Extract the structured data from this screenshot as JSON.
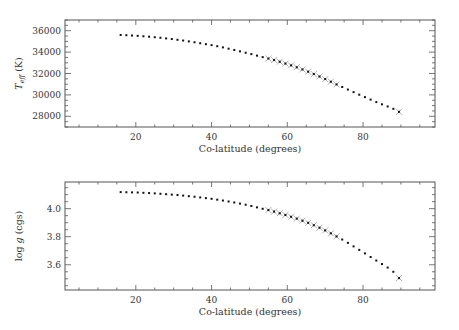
{
  "chart_data": [
    {
      "type": "scatter",
      "title": "",
      "xlabel": "Co-latitude (degrees)",
      "ylabel": "T_eff (K)",
      "ylabel_main": "T",
      "ylabel_sub": "eff",
      "ylabel_unit": " (K)",
      "xlim": [
        1.3,
        99
      ],
      "ylim": [
        27000,
        37000
      ],
      "xticks": [
        20,
        40,
        60,
        80
      ],
      "yticks": [
        28000,
        30000,
        32000,
        34000,
        36000
      ],
      "grid": false,
      "marker": "dot",
      "highlight_marker": "x",
      "highlight_range": [
        55,
        73
      ],
      "x": [
        16,
        17.5,
        19,
        20.5,
        22,
        23.5,
        25,
        26.5,
        28,
        29.5,
        31,
        32.5,
        34,
        35.5,
        37,
        38.5,
        40,
        41.5,
        43,
        44.5,
        46,
        47.5,
        49,
        50.5,
        52,
        53.5,
        55,
        56.5,
        58,
        59.5,
        61,
        62.5,
        64,
        65.5,
        67,
        68.5,
        70,
        71.5,
        73,
        74.5,
        76,
        77.5,
        79,
        80.5,
        82,
        83.5,
        85,
        86.5,
        88,
        89.5
      ],
      "values": [
        35600,
        35580,
        35550,
        35520,
        35480,
        35440,
        35390,
        35340,
        35280,
        35220,
        35150,
        35080,
        35000,
        34920,
        34830,
        34740,
        34650,
        34550,
        34440,
        34320,
        34200,
        34070,
        33940,
        33810,
        33670,
        33530,
        33400,
        33260,
        33100,
        32930,
        32760,
        32580,
        32380,
        32170,
        31950,
        31720,
        31480,
        31230,
        30980,
        30740,
        30500,
        30260,
        30020,
        29790,
        29560,
        29330,
        29120,
        28920,
        28700,
        28420
      ]
    },
    {
      "type": "scatter",
      "title": "",
      "xlabel": "Co-latitude (degrees)",
      "ylabel": "log g (cgs)",
      "ylabel_pre": "log ",
      "ylabel_g": "g",
      "ylabel_unit": " (cgs)",
      "xlim": [
        1.3,
        99
      ],
      "ylim": [
        3.42,
        4.19
      ],
      "xticks": [
        20,
        40,
        60,
        80
      ],
      "yticks": [
        3.6,
        3.8,
        4.0
      ],
      "ytick_labels": [
        "3.6",
        "3.8",
        "4.0"
      ],
      "grid": false,
      "marker": "dot",
      "highlight_marker": "x",
      "highlight_range": [
        55,
        73
      ],
      "x": [
        16,
        17.5,
        19,
        20.5,
        22,
        23.5,
        25,
        26.5,
        28,
        29.5,
        31,
        32.5,
        34,
        35.5,
        37,
        38.5,
        40,
        41.5,
        43,
        44.5,
        46,
        47.5,
        49,
        50.5,
        52,
        53.5,
        55,
        56.5,
        58,
        59.5,
        61,
        62.5,
        64,
        65.5,
        67,
        68.5,
        70,
        71.5,
        73,
        74.5,
        76,
        77.5,
        79,
        80.5,
        82,
        83.5,
        85,
        86.5,
        88,
        89.5
      ],
      "values": [
        4.118,
        4.117,
        4.116,
        4.115,
        4.113,
        4.111,
        4.109,
        4.106,
        4.103,
        4.1,
        4.097,
        4.093,
        4.089,
        4.085,
        4.08,
        4.075,
        4.07,
        4.064,
        4.058,
        4.051,
        4.044,
        4.036,
        4.028,
        4.019,
        4.009,
        3.999,
        3.99,
        3.979,
        3.967,
        3.955,
        3.942,
        3.929,
        3.914,
        3.899,
        3.882,
        3.864,
        3.845,
        3.824,
        3.802,
        3.78,
        3.756,
        3.731,
        3.706,
        3.681,
        3.655,
        3.63,
        3.605,
        3.58,
        3.55,
        3.505
      ]
    }
  ]
}
